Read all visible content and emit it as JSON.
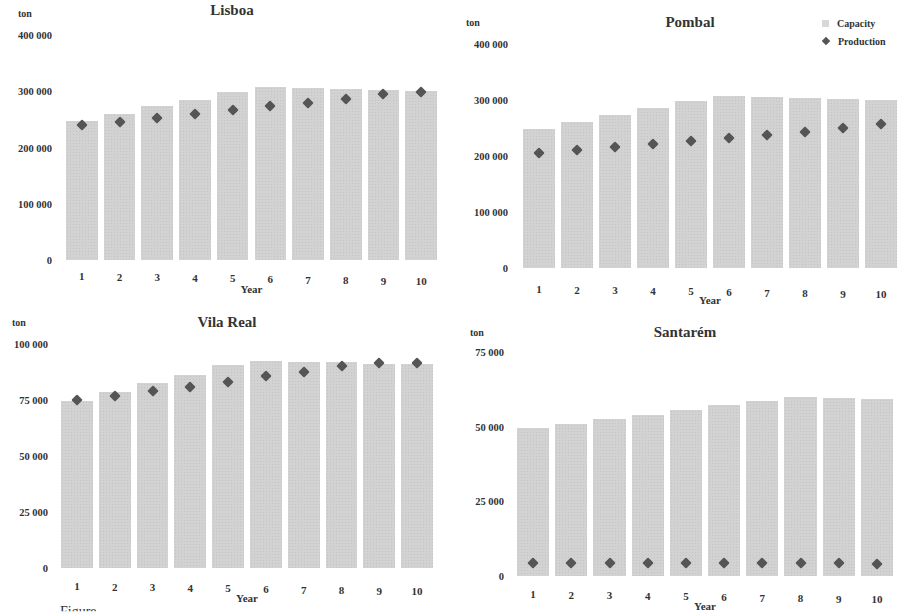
{
  "legend": {
    "capacity_label": "Capacity",
    "production_label": "Production"
  },
  "colors": {
    "capacity_bar": "#d2d2d2",
    "production_marker": "#555555"
  },
  "chart_data": [
    {
      "type": "bar",
      "title": "Lisboa",
      "xlabel": "Year",
      "ylabel": "ton",
      "categories": [
        "1",
        "2",
        "3",
        "4",
        "5",
        "6",
        "7",
        "8",
        "9",
        "10"
      ],
      "yticks": [
        "0",
        "100 000",
        "200 000",
        "300 000",
        "400 000"
      ],
      "ylim": [
        0,
        400000
      ],
      "series": [
        {
          "name": "Capacity",
          "kind": "bar",
          "values": [
            247000,
            260000,
            273000,
            285000,
            298000,
            307000,
            305000,
            304000,
            302000,
            300000
          ]
        },
        {
          "name": "Production",
          "kind": "marker",
          "values": [
            240000,
            246000,
            252000,
            259000,
            266000,
            273000,
            280000,
            287000,
            295000,
            299000
          ]
        }
      ]
    },
    {
      "type": "bar",
      "title": "Pombal",
      "xlabel": "Year",
      "ylabel": "ton",
      "categories": [
        "1",
        "2",
        "3",
        "4",
        "5",
        "6",
        "7",
        "8",
        "9",
        "10"
      ],
      "yticks": [
        "0",
        "100 000",
        "200 000",
        "300 000",
        "400 000"
      ],
      "ylim": [
        0,
        400000
      ],
      "legend_position": "top-right",
      "series": [
        {
          "name": "Capacity",
          "kind": "bar",
          "values": [
            248000,
            261000,
            273000,
            286000,
            298000,
            307000,
            305000,
            304000,
            302000,
            300000
          ]
        },
        {
          "name": "Production",
          "kind": "marker",
          "values": [
            205000,
            210000,
            216000,
            221000,
            227000,
            232000,
            238000,
            243000,
            250000,
            257000
          ]
        }
      ]
    },
    {
      "type": "bar",
      "title": "Vila Real",
      "xlabel": "Year",
      "ylabel": "ton",
      "categories": [
        "1",
        "2",
        "3",
        "4",
        "5",
        "6",
        "7",
        "8",
        "9",
        "10"
      ],
      "yticks": [
        "0",
        "25 000",
        "50 000",
        "75 000",
        "100 000"
      ],
      "ylim": [
        0,
        100000
      ],
      "series": [
        {
          "name": "Capacity",
          "kind": "bar",
          "values": [
            74500,
            78500,
            82500,
            86000,
            90500,
            92500,
            92000,
            92000,
            91000,
            91000
          ]
        },
        {
          "name": "Production",
          "kind": "marker",
          "values": [
            75000,
            77000,
            79000,
            81000,
            83000,
            85500,
            87500,
            90000,
            91500,
            91500
          ]
        }
      ]
    },
    {
      "type": "bar",
      "title": "Santarém",
      "xlabel": "Year",
      "ylabel": "ton",
      "categories": [
        "1",
        "2",
        "3",
        "4",
        "5",
        "6",
        "7",
        "8",
        "9",
        "10"
      ],
      "yticks": [
        "0",
        "25 000",
        "50 000",
        "75 000"
      ],
      "ylim": [
        0,
        75000
      ],
      "series": [
        {
          "name": "Capacity",
          "kind": "bar",
          "values": [
            49700,
            51000,
            52700,
            54000,
            55700,
            57300,
            58700,
            60000,
            59700,
            59300
          ]
        },
        {
          "name": "Production",
          "kind": "marker",
          "values": [
            4500,
            4500,
            4400,
            4400,
            4400,
            4300,
            4300,
            4200,
            4200,
            4100
          ]
        }
      ]
    }
  ],
  "layout": [
    {
      "title_x": 232,
      "title_y": 2,
      "unit_x": 18,
      "unit_y": 8,
      "plot_left": 63,
      "plot_right": 440,
      "y_top": 35,
      "y_zero": 260,
      "xtick_y": 270,
      "xlabel_y": 283,
      "ytick_right": 52
    },
    {
      "title_x": 690,
      "title_y": 14,
      "unit_x": 466,
      "unit_y": 17,
      "plot_left": 520,
      "plot_right": 900,
      "y_top": 44,
      "y_zero": 268,
      "xtick_y": 283,
      "xlabel_y": 294,
      "ytick_right": 508
    },
    {
      "title_x": 227,
      "title_y": 314,
      "unit_x": 12,
      "unit_y": 317,
      "plot_left": 58,
      "plot_right": 436,
      "y_top": 344,
      "y_zero": 568,
      "xtick_y": 580,
      "xlabel_y": 592,
      "ytick_right": 48
    },
    {
      "title_x": 685,
      "title_y": 324,
      "unit_x": 470,
      "unit_y": 327,
      "plot_left": 514,
      "plot_right": 896,
      "y_top": 352,
      "y_zero": 576,
      "xtick_y": 588,
      "xlabel_y": 600,
      "ytick_right": 504
    }
  ],
  "caption_fragment": "Figure"
}
